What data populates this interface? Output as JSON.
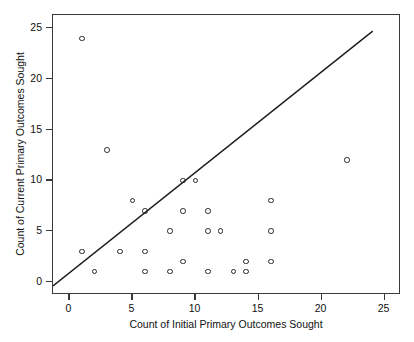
{
  "chart_data": {
    "type": "scatter",
    "title": "",
    "xlabel": "Count of Initial Primary Outcomes Sought",
    "ylabel": "Count of Current Primary Outcomes Sought",
    "xlim": [
      -1.3,
      26.3
    ],
    "ylim": [
      -1.3,
      26.3
    ],
    "xticks": [
      0,
      5,
      10,
      15,
      20,
      25
    ],
    "yticks": [
      0,
      5,
      10,
      15,
      20,
      25
    ],
    "xticklabels": [
      "0",
      "5",
      "10",
      "15",
      "20",
      "25"
    ],
    "yticklabels": [
      "0",
      "5",
      "10",
      "15",
      "20",
      "25"
    ],
    "grid": false,
    "legend": null,
    "marker_style": "open-circle",
    "marker_color": "#262626",
    "line_color": "#1a1a1a",
    "points": [
      {
        "x": 1,
        "y": 24
      },
      {
        "x": 3,
        "y": 13
      },
      {
        "x": 22,
        "y": 12
      },
      {
        "x": 9,
        "y": 10
      },
      {
        "x": 10,
        "y": 10
      },
      {
        "x": 5,
        "y": 8
      },
      {
        "x": 16,
        "y": 8
      },
      {
        "x": 6,
        "y": 7
      },
      {
        "x": 9,
        "y": 7
      },
      {
        "x": 11,
        "y": 7
      },
      {
        "x": 8,
        "y": 5
      },
      {
        "x": 11,
        "y": 5
      },
      {
        "x": 12,
        "y": 5
      },
      {
        "x": 16,
        "y": 5
      },
      {
        "x": 1,
        "y": 3
      },
      {
        "x": 4,
        "y": 3
      },
      {
        "x": 6,
        "y": 3
      },
      {
        "x": 9,
        "y": 2
      },
      {
        "x": 14,
        "y": 2
      },
      {
        "x": 16,
        "y": 2
      },
      {
        "x": 2,
        "y": 1
      },
      {
        "x": 6,
        "y": 1
      },
      {
        "x": 8,
        "y": 1
      },
      {
        "x": 11,
        "y": 1
      },
      {
        "x": 13,
        "y": 1
      },
      {
        "x": 14,
        "y": 1
      }
    ],
    "reference_line": {
      "label": "identity line",
      "equation": "y = x",
      "x_start": -1.3,
      "y_start": -0.6,
      "x_end": 24.2,
      "y_end": 24.7
    }
  }
}
